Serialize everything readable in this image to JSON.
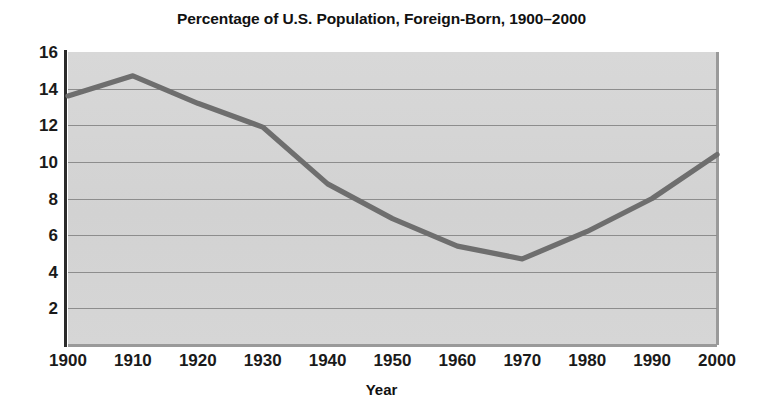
{
  "chart_data": {
    "type": "line",
    "title": "Percentage of U.S. Population, Foreign-Born, 1900–2000",
    "xlabel": "Year",
    "ylabel": "",
    "x": [
      1900,
      1910,
      1920,
      1930,
      1940,
      1950,
      1960,
      1970,
      1980,
      1990,
      2000
    ],
    "values": [
      13.6,
      14.7,
      13.2,
      11.9,
      8.8,
      6.9,
      5.4,
      4.7,
      6.2,
      8.0,
      10.4
    ],
    "series": [
      {
        "name": "Percentage foreign-born",
        "values": [
          13.6,
          14.7,
          13.2,
          11.9,
          8.8,
          6.9,
          5.4,
          4.7,
          6.2,
          8.0,
          10.4
        ]
      }
    ],
    "categories": [
      "1900",
      "1910",
      "1920",
      "1930",
      "1940",
      "1950",
      "1960",
      "1970",
      "1980",
      "1990",
      "2000"
    ],
    "xlim": [
      1900,
      2000
    ],
    "ylim": [
      0,
      16
    ],
    "ytick_labels": [
      "16",
      "14",
      "12",
      "10",
      "8",
      "6",
      "4",
      "2"
    ],
    "ytick_values": [
      16,
      14,
      12,
      10,
      8,
      6,
      4,
      2
    ],
    "xtick_labels": [
      "1900",
      "1910",
      "1920",
      "1930",
      "1940",
      "1950",
      "1960",
      "1970",
      "1980",
      "1990",
      "2000"
    ],
    "grid": "horizontal",
    "legend": "none",
    "colors": {
      "line": "#6e6e6e",
      "plot_background": "#d4d4d4",
      "gridline": "#8d8d8d",
      "axis": "#2b2b2b",
      "text": "#111111",
      "page_background": "#ffffff"
    }
  }
}
